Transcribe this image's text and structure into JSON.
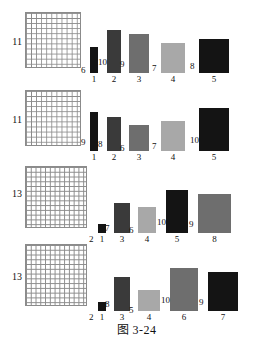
{
  "figure": {
    "caption": "图 3-24",
    "palette": {
      "black": "#141414",
      "dark_gray": "#3a3a3a",
      "mid_gray": "#6e6e6e",
      "light_gray": "#a8a8a8",
      "grid_line": "#8b8b8b",
      "text": "#111111"
    }
  },
  "chart_data": {
    "type": "bar",
    "title": "图 3-24",
    "xlabel": "",
    "ylabel": "",
    "ylim": [
      0,
      10
    ],
    "grid": false,
    "legend": null,
    "stages": [
      {
        "count_label": "11",
        "grid": {
          "rows": 11,
          "cols": 11
        },
        "categories": [
          "1",
          "2",
          "3",
          "4",
          "5"
        ],
        "values": [
          6,
          10,
          9,
          7,
          8
        ],
        "colors": [
          "#141414",
          "#3a3a3a",
          "#6e6e6e",
          "#a8a8a8",
          "#141414"
        ]
      },
      {
        "count_label": "11",
        "grid": {
          "rows": 11,
          "cols": 11
        },
        "categories": [
          "1",
          "2",
          "3",
          "4",
          "5"
        ],
        "values": [
          9,
          8,
          6,
          7,
          10
        ],
        "colors": [
          "#141414",
          "#3a3a3a",
          "#6e6e6e",
          "#a8a8a8",
          "#141414"
        ]
      },
      {
        "count_label": "13",
        "grid": {
          "rows": 13,
          "cols": 13
        },
        "categories": [
          "1",
          "3",
          "4",
          "5",
          "8"
        ],
        "values": [
          2,
          7,
          6,
          10,
          9
        ],
        "colors": [
          "#141414",
          "#3a3a3a",
          "#a8a8a8",
          "#141414",
          "#6e6e6e"
        ]
      },
      {
        "count_label": "13",
        "grid": {
          "rows": 13,
          "cols": 13
        },
        "categories": [
          "1",
          "3",
          "4",
          "6",
          "7"
        ],
        "values": [
          2,
          8,
          5,
          10,
          9
        ],
        "colors": [
          "#141414",
          "#3a3a3a",
          "#a8a8a8",
          "#6e6e6e",
          "#141414"
        ]
      }
    ]
  }
}
